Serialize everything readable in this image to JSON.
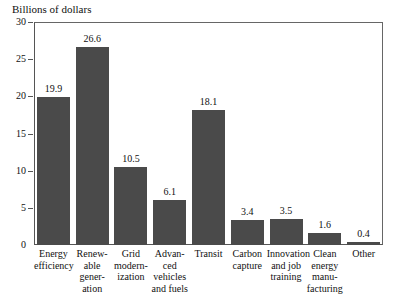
{
  "chart_data": {
    "type": "bar",
    "title": "Billions of dollars",
    "xlabel": "",
    "ylabel": "",
    "ylim": [
      0,
      30
    ],
    "ytick_labels": [
      "30",
      "25",
      "20",
      "15",
      "10",
      "5",
      "0"
    ],
    "yticks": [
      30,
      25,
      20,
      15,
      10,
      5,
      0
    ],
    "grid": false,
    "legend": "none",
    "bar_color": "#4a4a4a",
    "frame_color": "#555555",
    "categories": [
      "Energy efficiency",
      "Renewable generation",
      "Grid modernization",
      "Advanced vehicles and fuels",
      "Transit",
      "Carbon capture",
      "Innovation and job training",
      "Clean energy manufacturing",
      "Other"
    ],
    "category_lines": [
      [
        "Energy",
        "efficiency"
      ],
      [
        "Renew-",
        "able",
        "gener-",
        "ation"
      ],
      [
        "Grid",
        "modern-",
        "ization"
      ],
      [
        "Advan-",
        "ced",
        "vehicles",
        "and fuels"
      ],
      [
        "Transit"
      ],
      [
        "Carbon",
        "capture"
      ],
      [
        "Innovation",
        "and job",
        "training"
      ],
      [
        "Clean",
        "energy",
        "manu-",
        "facturing"
      ],
      [
        "Other"
      ]
    ],
    "values": [
      19.9,
      26.6,
      10.5,
      6.1,
      18.1,
      3.4,
      3.5,
      1.6,
      0.4
    ],
    "value_labels": [
      "19.9",
      "26.6",
      "10.5",
      "6.1",
      "18.1",
      "3.4",
      "3.5",
      "1.6",
      "0.4"
    ]
  }
}
